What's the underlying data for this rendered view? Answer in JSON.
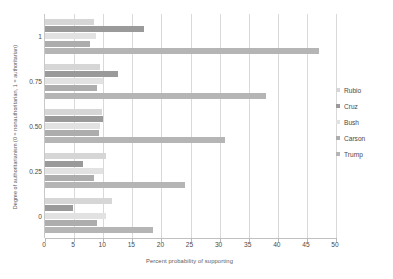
{
  "chart_data": {
    "type": "bar",
    "orientation": "horizontal",
    "title": "",
    "xlabel": "Percent probability of supporting",
    "ylabel": "Degree of authoritarianism (0 = nonauthoritarian, 1 = authoritarian)",
    "xlim": [
      0,
      50
    ],
    "ylim": [
      0,
      1
    ],
    "x_ticks": [
      0,
      5,
      10,
      15,
      20,
      25,
      30,
      35,
      40,
      45,
      50
    ],
    "x_tick_labels": [
      "0",
      "5",
      "10",
      "15",
      "20",
      "25",
      "30",
      "35",
      "40",
      "45",
      "50"
    ],
    "categories": [
      "0",
      "0.25",
      "0.50",
      "0.75",
      "1"
    ],
    "category_order_top_to_bottom": [
      "1",
      "0.75",
      "0.50",
      "0.25",
      "0"
    ],
    "grid": true,
    "legend_position": "right",
    "series": [
      {
        "name": "Rubio",
        "color": "#d6d6d6",
        "values": [
          11.5,
          10.5,
          9.8,
          9.5,
          8.5
        ]
      },
      {
        "name": "Cruz",
        "color": "#9a9a9a",
        "values": [
          4.8,
          6.5,
          10.0,
          12.5,
          17.0
        ]
      },
      {
        "name": "Bush",
        "color": "#e2e2e2",
        "values": [
          10.5,
          10.0,
          9.5,
          10.0,
          8.8
        ]
      },
      {
        "name": "Carson",
        "color": "#adadad",
        "values": [
          9.0,
          8.5,
          9.3,
          9.0,
          7.8
        ]
      },
      {
        "name": "Trump",
        "color": "#b5b5b5",
        "values": [
          18.5,
          24.0,
          31.0,
          38.0,
          47.0
        ]
      }
    ]
  },
  "legend": {
    "items": [
      {
        "label": "Rubio"
      },
      {
        "label": "Cruz"
      },
      {
        "label": "Bush"
      },
      {
        "label": "Carson"
      },
      {
        "label": "Trump"
      }
    ]
  }
}
